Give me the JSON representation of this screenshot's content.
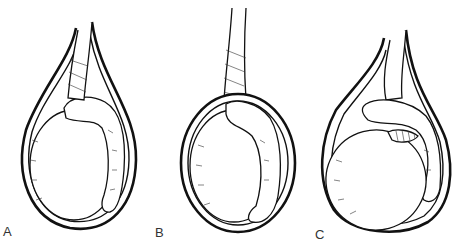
{
  "figure": {
    "panels": [
      {
        "label": "A",
        "description": "Intravaginal torsion: spermatic cord twisted within tunica vaginalis"
      },
      {
        "label": "B",
        "description": "Torsion with cord twisted above testis, tunica surrounding testis"
      },
      {
        "label": "C",
        "description": "Torsion between testis and epididymis"
      }
    ]
  }
}
